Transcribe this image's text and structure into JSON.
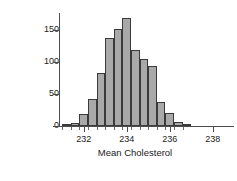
{
  "chart_data": {
    "type": "bar",
    "title": "",
    "subtitle": "",
    "xlabel": "Mean Cholesterol",
    "ylabel": "# of Samples",
    "xlim": [
      230.9,
      238.9
    ],
    "ylim": [
      0,
      175
    ],
    "grid": false,
    "legend": null,
    "bin_width": 0.4,
    "bar_color": "#a9a9a9",
    "bar_edge_color": "#3a3a3a",
    "axis_color": "#4d4d4d",
    "xticks": [
      {
        "value": 232,
        "label": "232"
      },
      {
        "value": 234,
        "label": "234"
      },
      {
        "value": 236,
        "label": "236"
      },
      {
        "value": 238,
        "label": "238"
      }
    ],
    "yticks": [
      {
        "value": 0,
        "label": "0"
      },
      {
        "value": 50,
        "label": "50"
      },
      {
        "value": 100,
        "label": "100"
      },
      {
        "value": 150,
        "label": "150"
      }
    ],
    "bins": [
      {
        "center": 231.2,
        "left": 231.0,
        "right": 231.4,
        "count": 2
      },
      {
        "center": 231.6,
        "left": 231.4,
        "right": 231.8,
        "count": 5
      },
      {
        "center": 232.0,
        "left": 231.8,
        "right": 232.2,
        "count": 19
      },
      {
        "center": 232.4,
        "left": 232.2,
        "right": 232.6,
        "count": 42
      },
      {
        "center": 232.8,
        "left": 232.6,
        "right": 233.0,
        "count": 83
      },
      {
        "center": 233.2,
        "left": 233.0,
        "right": 233.4,
        "count": 137
      },
      {
        "center": 233.6,
        "left": 233.4,
        "right": 233.8,
        "count": 151
      },
      {
        "center": 234.0,
        "left": 233.8,
        "right": 234.2,
        "count": 168
      },
      {
        "center": 234.4,
        "left": 234.2,
        "right": 234.6,
        "count": 119
      },
      {
        "center": 234.8,
        "left": 234.6,
        "right": 235.0,
        "count": 105
      },
      {
        "center": 235.2,
        "left": 235.0,
        "right": 235.4,
        "count": 93
      },
      {
        "center": 235.6,
        "left": 235.4,
        "right": 235.8,
        "count": 38
      },
      {
        "center": 236.0,
        "left": 235.8,
        "right": 236.2,
        "count": 20
      },
      {
        "center": 236.4,
        "left": 236.2,
        "right": 236.6,
        "count": 6
      },
      {
        "center": 236.8,
        "left": 236.6,
        "right": 237.0,
        "count": 2
      }
    ],
    "categories": [
      "231.2",
      "231.6",
      "232.0",
      "232.4",
      "232.8",
      "233.2",
      "233.6",
      "234.0",
      "234.4",
      "234.8",
      "235.2",
      "235.6",
      "236.0",
      "236.4",
      "236.8"
    ],
    "values": [
      2,
      5,
      19,
      42,
      83,
      137,
      151,
      168,
      119,
      105,
      93,
      38,
      20,
      6,
      2
    ]
  }
}
